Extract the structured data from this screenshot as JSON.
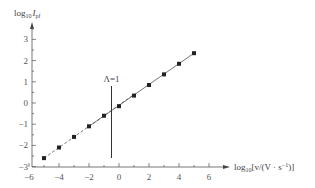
{
  "chart_data": {
    "type": "line",
    "title": "",
    "xlabel": "log10[v/(V·s^-1)]",
    "ylabel": "log10 Ipf",
    "xlim": [
      -6,
      7
    ],
    "ylim": [
      -3,
      3.5
    ],
    "x_ticks": [
      -6,
      -4,
      -2,
      0,
      2,
      4,
      6
    ],
    "y_ticks": [
      -3,
      -2,
      -1,
      0,
      1,
      2,
      3
    ],
    "grid": false,
    "annotations": [
      {
        "text": "Λ=1",
        "x": -0.5,
        "type": "vertical-line"
      }
    ],
    "series": [
      {
        "name": "data",
        "marker": "square",
        "x": [
          -5,
          -4,
          -3,
          -2,
          -1,
          0,
          1,
          2,
          3,
          4,
          5
        ],
        "y": [
          -2.6,
          -2.1,
          -1.6,
          -1.1,
          -0.6,
          -0.15,
          0.35,
          0.85,
          1.35,
          1.85,
          2.35
        ]
      },
      {
        "name": "dashed-fit",
        "style": "dashed",
        "x": [
          -5,
          1
        ],
        "y": [
          -2.6,
          0.4
        ]
      },
      {
        "name": "solid-fit",
        "style": "solid",
        "x": [
          -2,
          5
        ],
        "y": [
          -1.1,
          2.35
        ]
      }
    ]
  },
  "labels": {
    "y_axis_main": "log",
    "y_axis_sub": "10",
    "y_axis_var": "I",
    "y_axis_var_sub": "pf",
    "x_axis_main": "log",
    "x_axis_sub": "10",
    "x_axis_rest": "[v/(V · s",
    "x_axis_exp": "−1",
    "x_axis_close": ")]",
    "annotation": "Λ=1",
    "x_tick_labels": [
      "−6",
      "−4",
      "−2",
      "0",
      "2",
      "4",
      "6"
    ],
    "y_tick_labels": [
      "−3",
      "−2",
      "−1",
      "0",
      "1",
      "2",
      "3"
    ]
  }
}
